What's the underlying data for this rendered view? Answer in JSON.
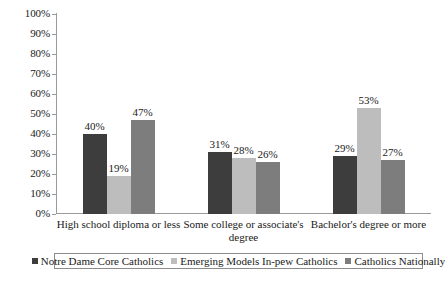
{
  "chart_data": {
    "type": "bar",
    "title": "",
    "subtitle": "",
    "xlabel": "",
    "ylabel": "",
    "ylim": [
      0,
      100
    ],
    "ytick_labels": [
      "100%",
      "90%",
      "80%",
      "70%",
      "60%",
      "50%",
      "40%",
      "30%",
      "20%",
      "10%",
      "0%"
    ],
    "ytick_values": [
      100,
      90,
      80,
      70,
      60,
      50,
      40,
      30,
      20,
      10,
      0
    ],
    "grid": false,
    "legend_position": "bottom",
    "value_suffix": "%",
    "categories": [
      "High school diploma or less",
      "Some college or associate's degree",
      "Bachelor's degree or more"
    ],
    "series": [
      {
        "name": "Notre Dame Core Catholics",
        "color": "#3d3d3d",
        "values": [
          40,
          31,
          29
        ],
        "labels": [
          "40%",
          "31%",
          "29%"
        ]
      },
      {
        "name": "Emerging Models In-pew Catholics",
        "color": "#bdbdbd",
        "values": [
          19,
          28,
          53
        ],
        "labels": [
          "19%",
          "28%",
          "53%"
        ]
      },
      {
        "name": "Catholics Nationally",
        "color": "#7d7d7d",
        "values": [
          47,
          26,
          27
        ],
        "labels": [
          "47%",
          "26%",
          "27%"
        ]
      }
    ]
  }
}
